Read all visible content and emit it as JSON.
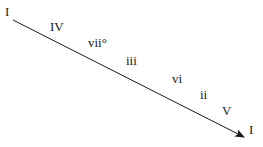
{
  "diagram": {
    "type": "chord-progression-arrow",
    "start_label": "I",
    "end_label": "I",
    "chords": [
      "IV",
      "vii°",
      "iii",
      "vi",
      "ii",
      "V"
    ]
  }
}
